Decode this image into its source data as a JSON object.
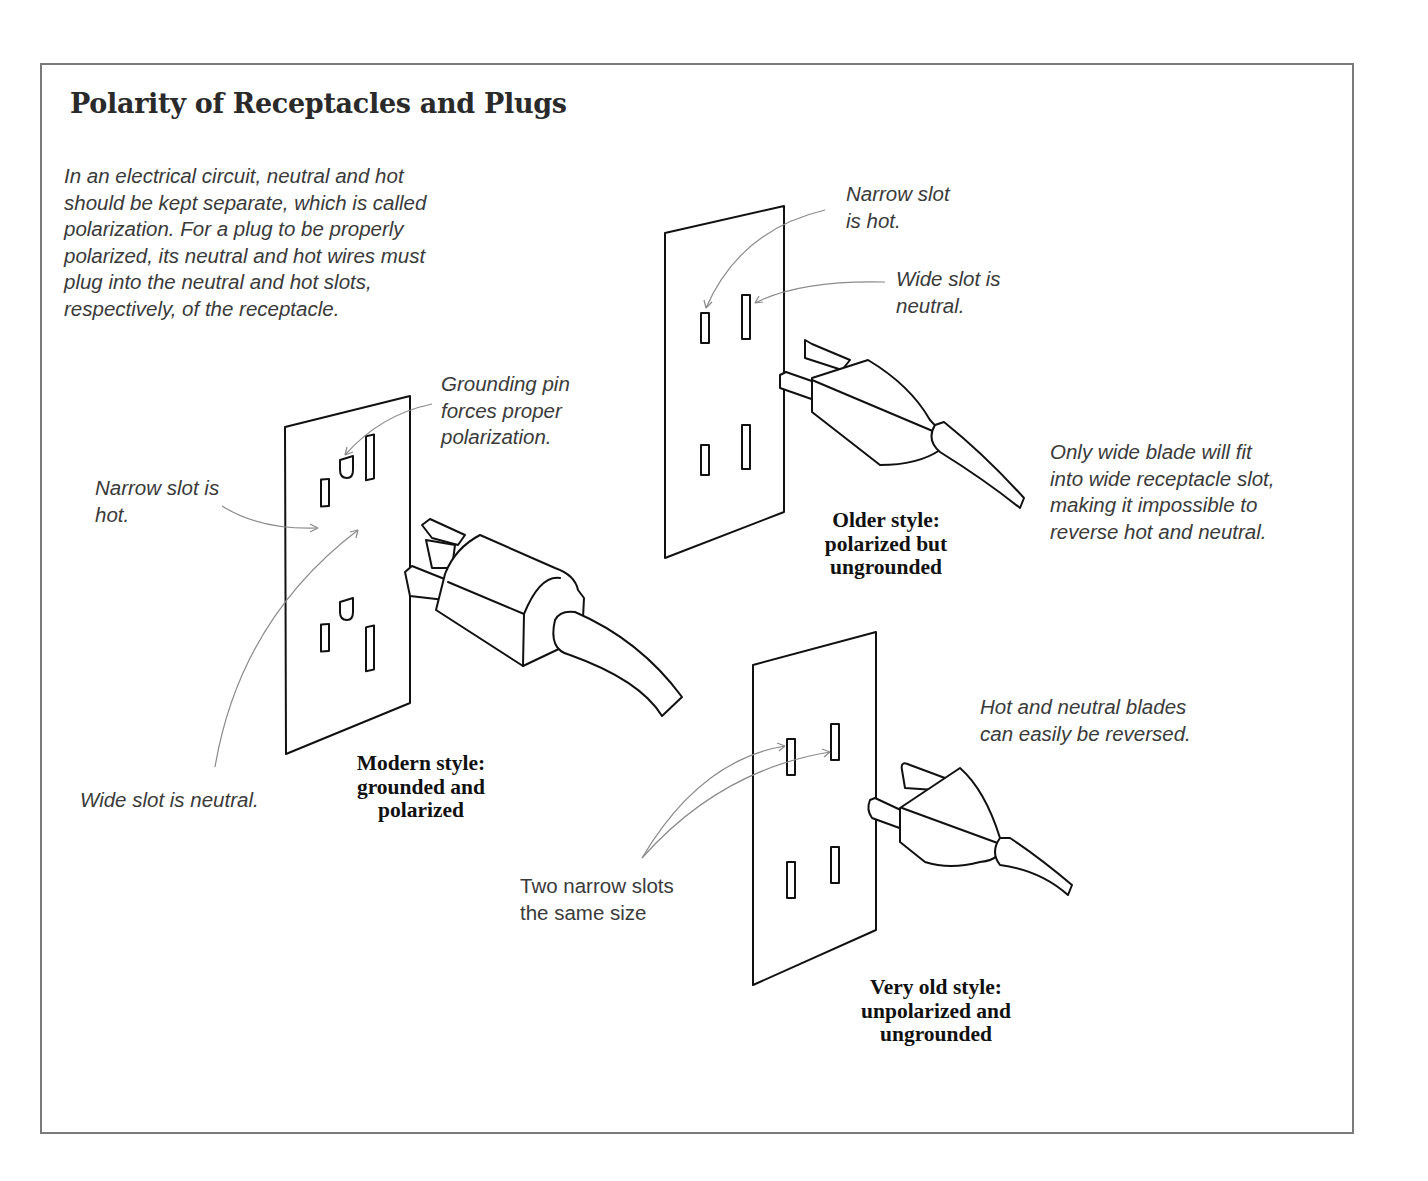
{
  "figure": {
    "title": "Polarity of  Receptacles and Plugs",
    "intro": "In an electrical circuit, neutral and hot\nshould be kept separate, which is called\npolarization. For a plug to be properly\npolarized, its neutral and hot wires must\nplug into the neutral and hot slots,\nrespectively, of the receptacle."
  },
  "panels": {
    "modern": {
      "caption": "Modern style:\ngrounded and\npolarized",
      "callouts": {
        "grounding_pin": "Grounding pin\nforces proper\npolarization.",
        "narrow_slot": "Narrow slot is\nhot.",
        "wide_slot": "Wide slot is neutral."
      }
    },
    "older": {
      "caption": "Older style:\npolarized but\nungrounded",
      "callouts": {
        "narrow_slot": "Narrow slot\nis hot.",
        "wide_slot": "Wide slot is\nneutral.",
        "wide_blade": "Only wide blade will fit\ninto wide receptacle slot,\nmaking it impossible to\nreverse hot and neutral."
      }
    },
    "very_old": {
      "caption": "Very old style:\nunpolarized and\nungrounded",
      "callouts": {
        "reversible": "Hot and neutral blades\ncan easily be reversed.",
        "two_narrow": "Two narrow slots\nthe same size"
      }
    }
  },
  "colors": {
    "ink": "#111111",
    "leader": "#8a8a8a",
    "frame": "#7a7a7a",
    "text": "#3a3a3a"
  }
}
